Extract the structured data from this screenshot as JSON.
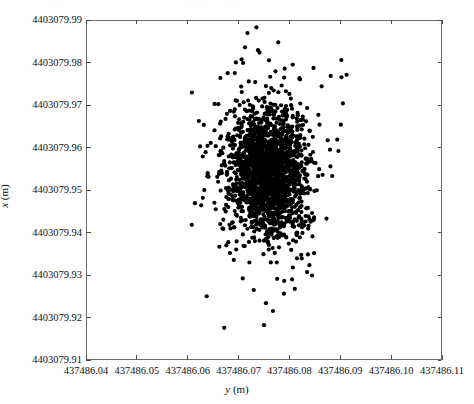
{
  "caption": {
    "text": "图 4-12 解算坐标散点分布图（测站 A）"
  },
  "chart_data": {
    "type": "scatter",
    "title": "",
    "xlabel": "y (m)",
    "ylabel": "x (m)",
    "xlabel_symbol": "y",
    "xlabel_unit": "(m)",
    "ylabel_symbol": "x",
    "ylabel_unit": "(m)",
    "xlim": [
      437486.04,
      437486.11
    ],
    "ylim": [
      4403079.91,
      4403079.99
    ],
    "xticks": [
      "437486.04",
      "437486.05",
      "437486.06",
      "437486.07",
      "437486.08",
      "437486.09",
      "437486.10",
      "437486.11"
    ],
    "yticks": [
      "4403079.91",
      "4403079.92",
      "4403079.93",
      "4403079.94",
      "4403079.95",
      "4403079.96",
      "4403079.97",
      "4403079.98",
      "4403079.99"
    ],
    "grid": false,
    "legend": null,
    "marker": {
      "shape": "circle",
      "color": "#000000",
      "size_px": 4.2
    },
    "n_points": 2000,
    "cluster": {
      "x_mean": 437486.0755,
      "y_mean": 4403079.9545,
      "x_std": 0.0035,
      "y_std": 0.007,
      "x_range": [
        437486.062,
        437486.091
      ],
      "y_range": [
        4403079.918,
        4403079.988
      ]
    },
    "outliers": [
      {
        "x": 437486.0735,
        "y": 4403079.9885,
        "note": "top isolated point"
      },
      {
        "x": 437486.075,
        "y": 4403079.918,
        "note": "bottom isolated point"
      }
    ],
    "axis_color": "#6e6e6e"
  }
}
